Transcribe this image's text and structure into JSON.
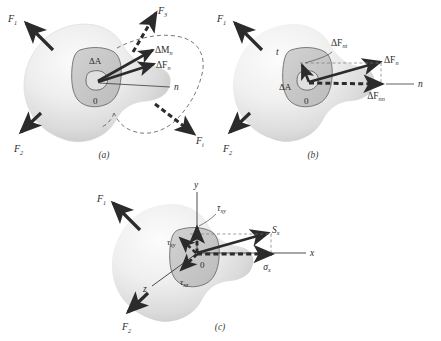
{
  "figure": {
    "type": "three-panel-stress-diagram",
    "background_color": "#ffffff",
    "ink_color": "#2b2b2b",
    "body_fill_light": "#f2f2f2",
    "body_fill_shadow": "#c9c9c9",
    "section_fill": "#c7c7c7",
    "core_fill": "#dcdcdc"
  },
  "panels": [
    {
      "id": "a",
      "caption": "(a)",
      "labels": {
        "force_1": "F",
        "force_1_sub": "1",
        "force_2": "F",
        "force_2_sub": "2",
        "force_3": "F",
        "force_3_sub": "3",
        "force_i": "F",
        "force_i_sub": "i",
        "delta_area": "ΔA",
        "origin": "0",
        "normal_axis": "n",
        "delta_moment": "ΔM",
        "delta_moment_sub": "n",
        "delta_force": "ΔF",
        "delta_force_sub": "n"
      }
    },
    {
      "id": "b",
      "caption": "(b)",
      "labels": {
        "force_1": "F",
        "force_1_sub": "1",
        "force_2": "F",
        "force_2_sub": "2",
        "delta_area": "ΔA",
        "origin": "0",
        "normal_axis": "n",
        "tangent_axis": "t",
        "delta_force_n": "ΔF",
        "delta_force_n_sub": "n",
        "delta_force_nt": "ΔF",
        "delta_force_nt_sub": "nt",
        "delta_force_nn": "ΔF",
        "delta_force_nn_sub": "nn"
      }
    },
    {
      "id": "c",
      "caption": "(c)",
      "labels": {
        "force_1": "F",
        "force_1_sub": "1",
        "force_2": "F",
        "force_2_sub": "2",
        "origin": "0",
        "axis_x": "x",
        "axis_y": "y",
        "axis_z": "z",
        "stress_resultant": "S",
        "stress_resultant_sub": "x",
        "normal_stress": "σ",
        "normal_stress_sub": "x",
        "shear_xy": "τ",
        "shear_xy_sub": "xy",
        "shear_xz": "τ",
        "shear_xz_sub": "xz",
        "shear_xy_left": "τ",
        "shear_xy_left_sub": "xy"
      }
    }
  ]
}
